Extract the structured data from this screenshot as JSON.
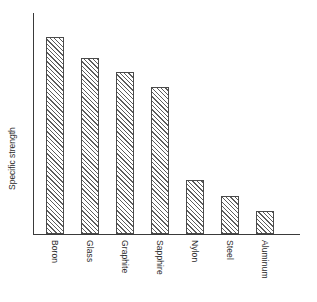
{
  "chart_data": {
    "type": "bar",
    "title": "",
    "subtitle": "",
    "xlabel": "",
    "ylabel": "Specific strength",
    "categories": [
      "Boron",
      "Glass",
      "Graphite",
      "Sapphire",
      "Nylon",
      "Steel",
      "Aluminum"
    ],
    "values": [
      98,
      87.5,
      80.5,
      73,
      27,
      19,
      11.5
    ],
    "ylim": [
      0,
      110
    ],
    "xlim": [
      0,
      7
    ],
    "grid": false,
    "legend": null,
    "tick_labels_y": [],
    "tick_labels_x": [
      "Boron",
      "Glass",
      "Graphite",
      "Sapphire",
      "Nylon",
      "Steel",
      "Aluminum"
    ],
    "annotations": [],
    "series": [
      {
        "name": "Specific strength",
        "values": [
          98,
          87.5,
          80.5,
          73,
          27,
          19,
          11.5
        ]
      }
    ]
  },
  "style": {
    "background": "#ffffff",
    "axis_color": "#3a3a3a",
    "bar_edge_color": "#4a4a4a",
    "bar_hatch_color": "#5c5c5c",
    "bar_fill_color": "#ffffff",
    "text_color": "#2b2b2b",
    "hatch_pattern": "diagonal-45"
  },
  "geometry": {
    "axis_left_px": 33,
    "axis_top_px": 13,
    "baseline_px": 234,
    "axis_right_px": 300,
    "bar_width_px": 18,
    "bar_pitch_px": 35,
    "first_bar_left_px": 46,
    "bar_tops_px": [
      38,
      60,
      74,
      90,
      181,
      196,
      211
    ]
  }
}
